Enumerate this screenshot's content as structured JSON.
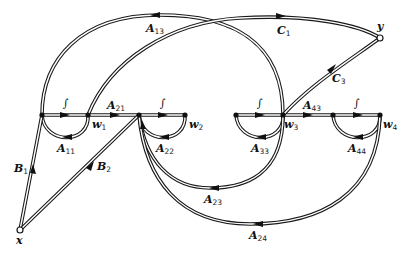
{
  "diagram": {
    "type": "signal-flow-graph",
    "nodes": {
      "x": {
        "label": "x",
        "kind": "input"
      },
      "y": {
        "label": "y",
        "kind": "output"
      },
      "w1": {
        "label": "w",
        "sub": "1"
      },
      "w2": {
        "label": "w",
        "sub": "2"
      },
      "w3": {
        "label": "w",
        "sub": "3"
      },
      "w4": {
        "label": "w",
        "sub": "4"
      }
    },
    "integrators": [
      "∫",
      "∫",
      "∫",
      "∫"
    ],
    "edges": {
      "A11": {
        "label": "A",
        "sub": "11"
      },
      "A13": {
        "label": "A",
        "sub": "13"
      },
      "A21": {
        "label": "A",
        "sub": "21"
      },
      "A22": {
        "label": "A",
        "sub": "22"
      },
      "A23": {
        "label": "A",
        "sub": "23"
      },
      "A24": {
        "label": "A",
        "sub": "24"
      },
      "A33": {
        "label": "A",
        "sub": "33"
      },
      "A43": {
        "label": "A",
        "sub": "43"
      },
      "A44": {
        "label": "A",
        "sub": "44"
      },
      "B1": {
        "label": "B",
        "sub": "1"
      },
      "B2": {
        "label": "B",
        "sub": "2"
      },
      "C1": {
        "label": "C",
        "sub": "1"
      },
      "C3": {
        "label": "C",
        "sub": "3"
      }
    }
  }
}
